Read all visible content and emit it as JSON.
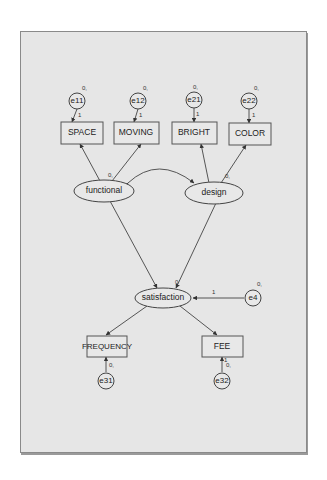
{
  "caption": "",
  "diagram": {
    "type": "structural-equation-model",
    "observed": [
      {
        "id": "SPACE",
        "label": "SPACE",
        "x": 82,
        "y": 133
      },
      {
        "id": "MOVING",
        "label": "MOVING",
        "x": 143,
        "y": 133
      },
      {
        "id": "BRIGHT",
        "label": "BRIGHT",
        "x": 202,
        "y": 133
      },
      {
        "id": "COLOR",
        "label": "COLOR",
        "x": 250,
        "y": 134
      },
      {
        "id": "FREQUENCY",
        "label": "FREQUENCY",
        "x": 106,
        "y": 346
      },
      {
        "id": "FEE",
        "label": "FEE",
        "x": 222,
        "y": 346
      }
    ],
    "latent": [
      {
        "id": "functional",
        "label": "functional",
        "x": 106,
        "y": 191
      },
      {
        "id": "design",
        "label": "design",
        "x": 214,
        "y": 193
      },
      {
        "id": "satisfaction",
        "label": "satisfaction",
        "x": 163,
        "y": 298
      }
    ],
    "errors": [
      {
        "id": "e11",
        "label": "e11",
        "x": 77,
        "y": 101,
        "mean_var": "0,",
        "weight": "1"
      },
      {
        "id": "e12",
        "label": "e12",
        "x": 138,
        "y": 101,
        "mean_var": "0,",
        "weight": "1"
      },
      {
        "id": "e21",
        "label": "e21",
        "x": 194,
        "y": 100,
        "mean_var": "0,",
        "weight": "1"
      },
      {
        "id": "e22",
        "label": "e22",
        "x": 249,
        "y": 101,
        "mean_var": "0,",
        "weight": "1"
      },
      {
        "id": "e4",
        "label": "e4",
        "x": 255,
        "y": 298,
        "mean_var": "0,",
        "weight": "1"
      },
      {
        "id": "e31",
        "label": "e31",
        "x": 106,
        "y": 381,
        "mean_var": "0,",
        "weight": "1"
      },
      {
        "id": "e32",
        "label": "e32",
        "x": 222,
        "y": 381,
        "mean_var": "0,",
        "weight": "1"
      }
    ],
    "latent_labels": {
      "functional": "0,",
      "design": "0,",
      "satisfaction": "0"
    },
    "paths": [
      {
        "from": "functional",
        "to": "SPACE"
      },
      {
        "from": "functional",
        "to": "MOVING"
      },
      {
        "from": "design",
        "to": "BRIGHT"
      },
      {
        "from": "design",
        "to": "COLOR"
      },
      {
        "from": "functional",
        "to": "satisfaction"
      },
      {
        "from": "design",
        "to": "satisfaction"
      },
      {
        "from": "satisfaction",
        "to": "FREQUENCY"
      },
      {
        "from": "satisfaction",
        "to": "FEE"
      },
      {
        "from": "e4",
        "to": "satisfaction",
        "label": "1"
      }
    ],
    "covariances": [
      {
        "between": [
          "functional",
          "design"
        ]
      }
    ]
  }
}
